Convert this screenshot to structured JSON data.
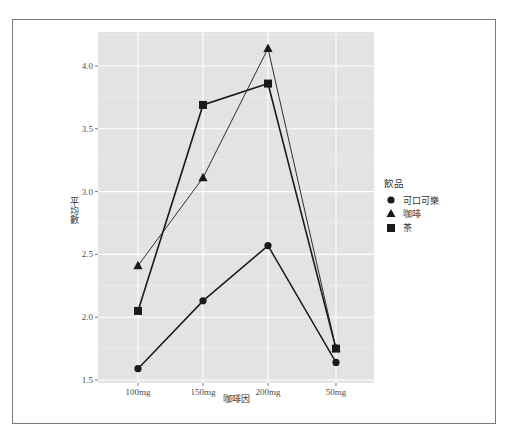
{
  "chart_data": {
    "type": "line",
    "title": "",
    "xlabel": "咖啡因",
    "ylabel": "平均數",
    "categories": [
      "100mg",
      "150mg",
      "200mg",
      "50mg"
    ],
    "series": [
      {
        "name": "可口可樂",
        "marker": "circle",
        "values": [
          1.59,
          2.13,
          2.57,
          1.64
        ]
      },
      {
        "name": "咖啡",
        "marker": "triangle",
        "values": [
          2.41,
          3.11,
          4.14,
          1.75
        ]
      },
      {
        "name": "茶",
        "marker": "square",
        "values": [
          2.05,
          3.69,
          3.86,
          1.75
        ]
      }
    ],
    "y_ticks": [
      "1.5",
      "2.0",
      "2.5",
      "3.0",
      "3.5",
      "4.0"
    ],
    "ylim": [
      1.5,
      4.2
    ],
    "grid": true,
    "legend": {
      "title": "飲品",
      "position": "right"
    }
  },
  "colors": {
    "panel_bg": "#e3e3e3",
    "grid_major": "#ffffff",
    "line": "#1a1a1a",
    "frame": "#7a7a7a"
  }
}
